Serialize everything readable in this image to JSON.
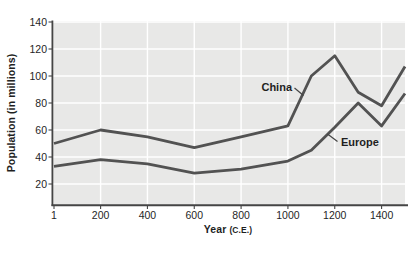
{
  "figure": {
    "background": "#ffffff"
  },
  "chart_data": {
    "type": "line",
    "title": "",
    "ylabel": "Population (in millions)",
    "xlabel": "Year",
    "xlabel_unit": "(C.E.)",
    "x": [
      1,
      200,
      400,
      600,
      800,
      1000,
      1100,
      1200,
      1300,
      1400,
      1500
    ],
    "series": [
      {
        "name": "China",
        "color": "#525252",
        "values": [
          50,
          60,
          55,
          47,
          55,
          63,
          100,
          115,
          88,
          78,
          107
        ]
      },
      {
        "name": "Europe",
        "color": "#525252",
        "values": [
          33,
          38,
          35,
          28,
          31,
          37,
          45,
          62,
          80,
          63,
          87
        ]
      }
    ],
    "x_ticks": [
      1,
      200,
      400,
      600,
      800,
      1000,
      1200,
      1400
    ],
    "y_ticks": [
      20,
      40,
      60,
      80,
      100,
      120,
      140
    ],
    "xlim": [
      1,
      1500
    ],
    "ylim": [
      4,
      141
    ],
    "grid": true,
    "legend_position": "inline-annotations",
    "plot_bg": "#e8e8e7",
    "grid_color": "#ffffff",
    "axis_color": "#454545",
    "text_color": "#1f1f1f"
  }
}
